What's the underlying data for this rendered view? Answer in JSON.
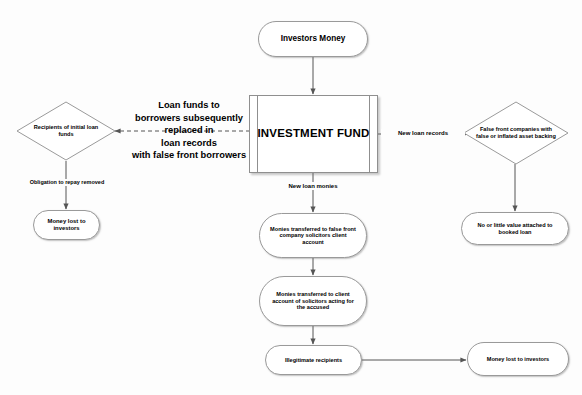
{
  "diagram": {
    "colors": {
      "stroke": "#8f8f8f",
      "text": "#000000",
      "background": "#fdfdfd",
      "edge": "#555555"
    },
    "nodes": {
      "investors_money": {
        "label": "Investors Money",
        "shape": "rounded"
      },
      "investment_fund": {
        "label": "INVESTMENT FUND",
        "shape": "predefined-process"
      },
      "recipients_initial_loan": {
        "label": "Recipients of initial loan funds",
        "shape": "diamond"
      },
      "false_front_companies": {
        "label": "False front companies with false or inflated asset backing",
        "shape": "diamond"
      },
      "money_lost_left": {
        "label": "Money lost to investors",
        "shape": "rounded"
      },
      "no_value_booked_loan": {
        "label": "No or little value attached to booked loan",
        "shape": "rounded"
      },
      "false_front_solicitors": {
        "label": "Monies transferred to false front company solicitors client account",
        "shape": "rounded"
      },
      "accused_solicitors": {
        "label": "Monies transferred to client account of solicitors acting for the accused",
        "shape": "rounded"
      },
      "illegitimate_recipients": {
        "label": "Illegitimate recipients",
        "shape": "rounded"
      },
      "money_lost_right": {
        "label": "Money lost to investors",
        "shape": "rounded"
      }
    },
    "edge_labels": {
      "loan_funds_replaced": "Loan funds to\nborrowers subsequently\nreplaced in\nloan records\nwith false front borrowers",
      "loan_funds_l1": "Loan funds to",
      "loan_funds_l2": "borrowers subsequently",
      "loan_funds_l3": "replaced in",
      "loan_funds_l4": "loan records",
      "loan_funds_l5": "with false front borrowers",
      "new_loan_records": "New loan records",
      "new_loan_monies": "New loan monies",
      "obligation_removed": "Obligation to repay removed"
    }
  }
}
